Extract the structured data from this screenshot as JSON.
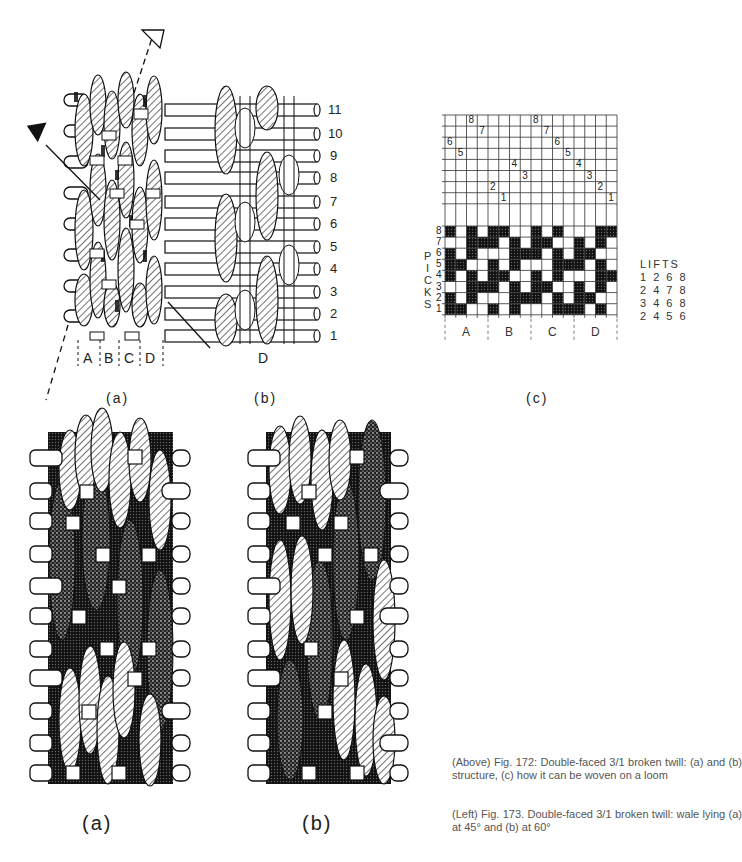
{
  "figure_172": {
    "a": {
      "label": "(a)",
      "column_labels": [
        "A",
        "B",
        "C",
        "D"
      ]
    },
    "b": {
      "label": "(b)",
      "column_label": "D",
      "pick_numbers": [
        "11",
        "10",
        "9",
        "8",
        "7",
        "6",
        "5",
        "4",
        "3",
        "2",
        "1"
      ]
    },
    "c": {
      "label": "(c)",
      "picks_label": [
        "P",
        "I",
        "C",
        "K",
        "S"
      ],
      "pick_row_numbers": [
        "8",
        "7",
        "6",
        "5",
        "4",
        "3",
        "2",
        "1"
      ],
      "column_groups": [
        "A",
        "B",
        "C",
        "D"
      ],
      "threading_numbers": [
        {
          "text": "8",
          "col": 3,
          "row": 0
        },
        {
          "text": "7",
          "col": 4,
          "row": 1
        },
        {
          "text": "6",
          "col": 1,
          "row": 2
        },
        {
          "text": "5",
          "col": 2,
          "row": 3
        },
        {
          "text": "4",
          "col": 7,
          "row": 4
        },
        {
          "text": "3",
          "col": 8,
          "row": 5
        },
        {
          "text": "2",
          "col": 5,
          "row": 6
        },
        {
          "text": "1",
          "col": 6,
          "row": 7
        },
        {
          "text": "8",
          "col": 9,
          "row": 0
        },
        {
          "text": "7",
          "col": 10,
          "row": 1
        },
        {
          "text": "6",
          "col": 11,
          "row": 2
        },
        {
          "text": "5",
          "col": 12,
          "row": 3
        },
        {
          "text": "4",
          "col": 13,
          "row": 4
        },
        {
          "text": "3",
          "col": 14,
          "row": 5
        },
        {
          "text": "2",
          "col": 15,
          "row": 6
        },
        {
          "text": "1",
          "col": 16,
          "row": 7
        }
      ],
      "weave_rows": {
        "8": "X_X_XX__X_X___XX",
        "7": "__XXX_X_XX__X_X_",
        "6": "X_X___XXX_X_XX__",
        "5": "XX__X_X___XXX_X_",
        "4": "X_X_XX__X_X___XX",
        "3": "__XXX_X_XX__X_X_",
        "2": "X_X___XXX_X_XX__",
        "1": "XX__X_X___XXX_X_"
      },
      "lifts": {
        "title": "LIFTS",
        "rows": [
          "1 2 6 8",
          "2 4 7 8",
          "3 4 6 8",
          "2 4 5 6"
        ]
      }
    }
  },
  "figure_173": {
    "a": {
      "label": "(a)"
    },
    "b": {
      "label": "(b)"
    }
  },
  "captions": {
    "above": "(Above) Fig. 172: Double-faced 3/1 broken twill: (a) and (b) structure, (c) how it can be woven on a loom",
    "left": "(Left) Fig. 173. Double-faced 3/1 broken twill: wale lying (a) at 45° and (b) at 60°"
  },
  "colors": {
    "ink": "#111111",
    "paper": "#ffffff",
    "caption_text": "#555555"
  }
}
